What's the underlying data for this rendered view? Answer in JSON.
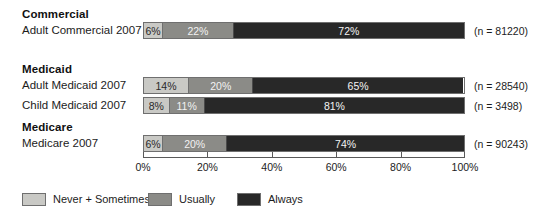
{
  "chart_data": {
    "type": "bar",
    "orientation": "horizontal",
    "stacked": true,
    "title": "",
    "xlabel": "",
    "ylabel": "",
    "xlim": [
      0,
      100
    ],
    "xticks": [
      "0%",
      "20%",
      "40%",
      "60%",
      "80%",
      "100%"
    ],
    "xtick_values": [
      0,
      20,
      40,
      60,
      80,
      100
    ],
    "grid": false,
    "legend_position": "bottom-left",
    "series": [
      {
        "name": "Never + Sometimes",
        "color": "#c9c9c5",
        "values": [
          6,
          14,
          8,
          6
        ]
      },
      {
        "name": "Usually",
        "color": "#8b8b87",
        "values": [
          22,
          20,
          11,
          20
        ]
      },
      {
        "name": "Always",
        "color": "#282828",
        "values": [
          72,
          65,
          81,
          74
        ]
      }
    ],
    "categories": [
      "Adult Commercial 2007",
      "Adult Medicaid 2007",
      "Child Medicaid 2007",
      "Medicare 2007"
    ],
    "annotations": [
      "(n = 81220)",
      "(n = 28540)",
      "(n = 3498)",
      "(n = 90243)"
    ]
  },
  "groups": [
    {
      "heading": "Commercial",
      "rows": [
        {
          "label": "Adult Commercial 2007",
          "n_label": "(n = 81220)",
          "segments": [
            {
              "key": "never",
              "value": 6,
              "label": "6%"
            },
            {
              "key": "usually",
              "value": 22,
              "label": "22%"
            },
            {
              "key": "always",
              "value": 72,
              "label": "72%"
            }
          ]
        }
      ]
    },
    {
      "heading": "Medicaid",
      "rows": [
        {
          "label": "Adult Medicaid 2007",
          "n_label": "(n = 28540)",
          "segments": [
            {
              "key": "never",
              "value": 14,
              "label": "14%"
            },
            {
              "key": "usually",
              "value": 20,
              "label": "20%"
            },
            {
              "key": "always",
              "value": 65,
              "label": "65%"
            }
          ]
        },
        {
          "label": "Child Medicaid 2007",
          "n_label": "(n = 3498)",
          "segments": [
            {
              "key": "never",
              "value": 8,
              "label": "8%"
            },
            {
              "key": "usually",
              "value": 11,
              "label": "11%"
            },
            {
              "key": "always",
              "value": 81,
              "label": "81%"
            }
          ]
        }
      ]
    },
    {
      "heading": "Medicare",
      "rows": [
        {
          "label": "Medicare 2007",
          "n_label": "(n = 90243)",
          "segments": [
            {
              "key": "never",
              "value": 6,
              "label": "6%"
            },
            {
              "key": "usually",
              "value": 20,
              "label": "20%"
            },
            {
              "key": "always",
              "value": 74,
              "label": "74%"
            }
          ]
        }
      ]
    }
  ],
  "axis": {
    "ticks": [
      {
        "label": "0%",
        "value": 0
      },
      {
        "label": "20%",
        "value": 20
      },
      {
        "label": "40%",
        "value": 40
      },
      {
        "label": "60%",
        "value": 60
      },
      {
        "label": "80%",
        "value": 80
      },
      {
        "label": "100%",
        "value": 100
      }
    ]
  },
  "legend": {
    "items": [
      {
        "label": "Never + Sometimes",
        "key": "never"
      },
      {
        "label": "Usually",
        "key": "usually"
      },
      {
        "label": "Always",
        "key": "always"
      }
    ]
  },
  "colors": {
    "never": "#c9c9c5",
    "usually": "#8b8b87",
    "always": "#282828",
    "background": "#ffffff",
    "text": "#1c1c1c",
    "axis": "#5a5a5a"
  }
}
